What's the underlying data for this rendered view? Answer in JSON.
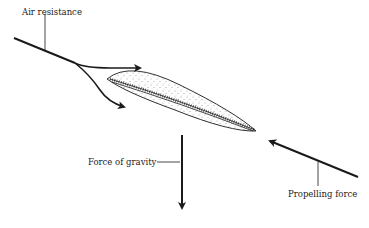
{
  "diagram": {
    "type": "force-diagram",
    "labels": {
      "air_resistance": "Air resistance",
      "gravity": "Force of gravity",
      "propelling": "Propelling force"
    },
    "colors": {
      "ink": "#1a1a1a",
      "stipple": "#555555",
      "background": "#ffffff"
    }
  }
}
